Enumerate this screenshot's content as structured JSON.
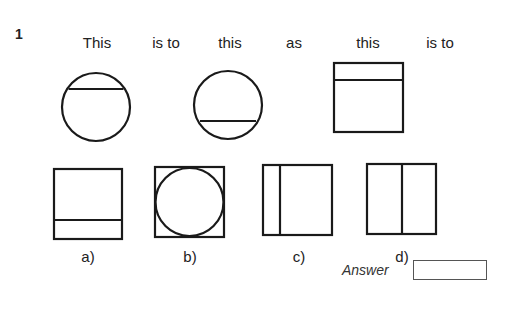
{
  "question": {
    "number": "1",
    "prompt_words": [
      "This",
      "is to",
      "this",
      "as",
      "this",
      "is to"
    ],
    "figures": {
      "this_1": {
        "shape": "circle",
        "chord": "top"
      },
      "this_2": {
        "shape": "circle",
        "chord": "bottom"
      },
      "this_3": {
        "shape": "square",
        "band": "top"
      }
    },
    "options": [
      {
        "label": "a)",
        "shape": "square",
        "band": "bottom"
      },
      {
        "label": "b)",
        "shape": "square",
        "inscribed": "circle"
      },
      {
        "label": "c)",
        "shape": "square",
        "band": "left"
      },
      {
        "label": "d)",
        "shape": "square",
        "divider": "vertical-right-of-center"
      }
    ],
    "answer_label": "Answer",
    "answer_value": ""
  },
  "colors": {
    "stroke": "#1a1a1a",
    "text": "#222222"
  }
}
